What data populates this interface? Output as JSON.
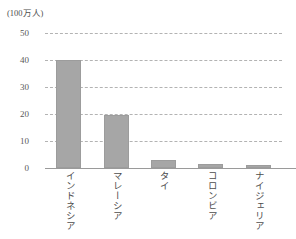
{
  "chart_data": {
    "type": "bar",
    "title": "",
    "unit_caption": "(100万人)",
    "categories": [
      "インドネシア",
      "マレーシア",
      "タイ",
      "コロンビア",
      "ナイジェリア"
    ],
    "values": [
      40,
      19.5,
      3,
      1.5,
      1
    ],
    "xlabel": "",
    "ylabel": "",
    "ylim": [
      0,
      50
    ],
    "yticks": [
      50,
      40,
      30,
      20,
      10,
      0
    ],
    "ytick_labels": [
      "50",
      "40",
      "30",
      "20",
      "10",
      "0"
    ],
    "grid": true,
    "grid_style": "dashed",
    "legend": false,
    "bar_color": "#a6a6a6",
    "grid_color": "#b3b3b3",
    "axis_color": "#9a9a9a",
    "text_color": "#4d4d4d"
  }
}
